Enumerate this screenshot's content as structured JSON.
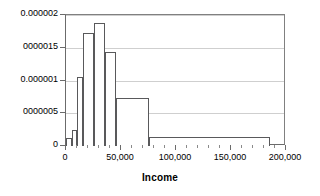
{
  "chart_data": {
    "type": "bar",
    "title": "",
    "subtitle": "",
    "xlabel": "Income",
    "ylabel": "",
    "grid": true,
    "legend": false,
    "orientation": "vertical",
    "xlim": [
      0,
      200000
    ],
    "ylim": [
      0,
      2e-06
    ],
    "xticks": [
      0,
      50000,
      100000,
      150000,
      200000
    ],
    "xticklabels": [
      "0",
      "50,000",
      "100,000",
      "150,000",
      "200,000"
    ],
    "x_minor_ticks": [
      10000,
      20000,
      30000,
      40000,
      60000,
      70000,
      80000,
      90000,
      110000,
      120000,
      130000,
      140000,
      160000,
      170000,
      180000,
      190000
    ],
    "yticks": [
      0,
      5e-07,
      1e-06,
      1.5e-06,
      2e-06
    ],
    "yticklabels": [
      "0",
      "0000005",
      "0.000001",
      "0000015",
      "0.000002"
    ],
    "bins": [
      {
        "x0": 0,
        "x1": 5000,
        "value": 1.2e-07
      },
      {
        "x0": 5000,
        "x1": 10000,
        "value": 2.4e-07
      },
      {
        "x0": 10000,
        "x1": 15000,
        "value": 1.05e-06
      },
      {
        "x0": 15000,
        "x1": 25000,
        "value": 1.72e-06
      },
      {
        "x0": 25000,
        "x1": 35000,
        "value": 1.88e-06
      },
      {
        "x0": 35000,
        "x1": 45000,
        "value": 1.44e-06
      },
      {
        "x0": 45000,
        "x1": 75000,
        "value": 7.4e-07
      },
      {
        "x0": 75000,
        "x1": 185000,
        "value": 1.3e-07
      }
    ],
    "categories": [
      "0-5,000",
      "5,000-10,000",
      "10,000-15,000",
      "15,000-25,000",
      "25,000-35,000",
      "35,000-45,000",
      "45,000-75,000",
      "75,000-185,000"
    ],
    "values": [
      1.2e-07,
      2.4e-07,
      1.05e-06,
      1.72e-06,
      1.88e-06,
      1.44e-06,
      7.4e-07,
      1.3e-07
    ],
    "colors": {
      "bar_fill": "#ffffff",
      "bar_edge": "#59595b",
      "gridline": "#cfcfcf",
      "axis": "#6b6b6b",
      "text": "#000000",
      "background": "#ffffff"
    }
  }
}
